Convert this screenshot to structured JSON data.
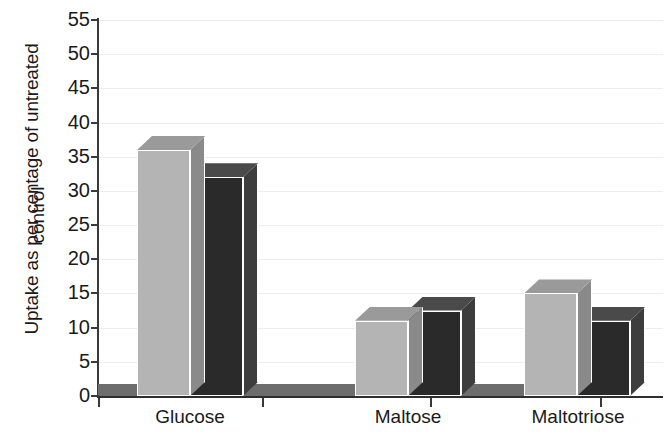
{
  "chart_data": {
    "type": "bar",
    "title": "",
    "subtitle": "",
    "xlabel": "",
    "ylabel_line1": "Uptake as per centage of untreated",
    "ylabel_line2": "control",
    "categories": [
      "Glucose",
      "Maltose",
      "Maltotriose"
    ],
    "series": [
      {
        "name": "light-gray-series",
        "color": "#b4b4b4",
        "values": [
          36,
          11,
          15
        ]
      },
      {
        "name": "dark-series",
        "color": "#2a2a2a",
        "values": [
          32,
          12.5,
          11
        ]
      }
    ],
    "ylim": [
      0,
      55
    ],
    "ytick_step": 5,
    "yticks": [
      "55",
      "50",
      "45",
      "40",
      "35",
      "30",
      "25",
      "20",
      "15",
      "10",
      "5",
      "0"
    ],
    "grid": "horizontal-light",
    "legend_position": "none",
    "style": "3d-bars"
  }
}
